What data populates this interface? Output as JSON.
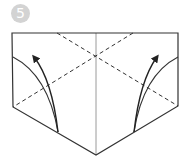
{
  "step": {
    "number": "5",
    "badge_color": "#d3d3d3",
    "badge_text_color": "#ffffff"
  },
  "diagram": {
    "line_color": "#333333",
    "crease_color": "#9a9a9a",
    "outline": [
      [
        12,
        33
      ],
      [
        178,
        33
      ],
      [
        178,
        106
      ],
      [
        96,
        155
      ],
      [
        13,
        107
      ]
    ],
    "center_line": [
      [
        96,
        33
      ],
      [
        96,
        155
      ]
    ],
    "valley_folds": [
      {
        "from": [
          57,
          33
        ],
        "to": [
          178,
          106
        ]
      },
      {
        "from": [
          133,
          33
        ],
        "to": [
          13,
          107
        ]
      }
    ],
    "fold_curves": [
      {
        "side": "left",
        "from": [
          13,
          57
        ],
        "ctrl": [
          48,
          75
        ],
        "to": [
          58,
          132
        ]
      },
      {
        "side": "right",
        "from": [
          178,
          57
        ],
        "ctrl": [
          143,
          75
        ],
        "to": [
          134,
          132
        ]
      }
    ],
    "arrows": [
      {
        "side": "left",
        "from": [
          58,
          132
        ],
        "ctrl": [
          52,
          80
        ],
        "tip": [
          31,
          52
        ]
      },
      {
        "side": "right",
        "from": [
          134,
          132
        ],
        "ctrl": [
          140,
          80
        ],
        "tip": [
          160,
          52
        ]
      }
    ]
  }
}
